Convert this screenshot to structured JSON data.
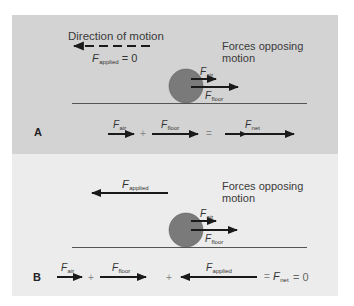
{
  "colors": {
    "panel_a_bg": "#d3d3d3",
    "panel_b_bg": "#ececec",
    "ball": "#7a7a7a",
    "arrow": "#1a1a1a",
    "floor": "#555555"
  },
  "panel_a": {
    "label": "A",
    "direction_label": "Direction of motion",
    "applied_force": {
      "symbol": "F",
      "sub": "applied",
      "value_text": "= 0"
    },
    "opposing_label_line1": "Forces opposing",
    "opposing_label_line2": "motion",
    "ball_forces": [
      {
        "symbol": "F",
        "sub": "air"
      },
      {
        "symbol": "F",
        "sub": "floor"
      }
    ],
    "equation": {
      "term1": {
        "symbol": "F",
        "sub": "air"
      },
      "plus": "+",
      "term2": {
        "symbol": "F",
        "sub": "floor"
      },
      "equals": "=",
      "result": {
        "symbol": "F",
        "sub": "net"
      }
    }
  },
  "panel_b": {
    "label": "B",
    "applied_force": {
      "symbol": "F",
      "sub": "applied"
    },
    "opposing_label_line1": "Forces opposing",
    "opposing_label_line2": "motion",
    "ball_forces": [
      {
        "symbol": "F",
        "sub": "air"
      },
      {
        "symbol": "F",
        "sub": "floor"
      }
    ],
    "equation": {
      "term1": {
        "symbol": "F",
        "sub": "air"
      },
      "plus1": "+",
      "term2": {
        "symbol": "F",
        "sub": "floor"
      },
      "plus2": "+",
      "term3": {
        "symbol": "F",
        "sub": "applied"
      },
      "equals1": "=",
      "result": {
        "symbol": "F",
        "sub": "net"
      },
      "equals2": "= 0"
    }
  }
}
